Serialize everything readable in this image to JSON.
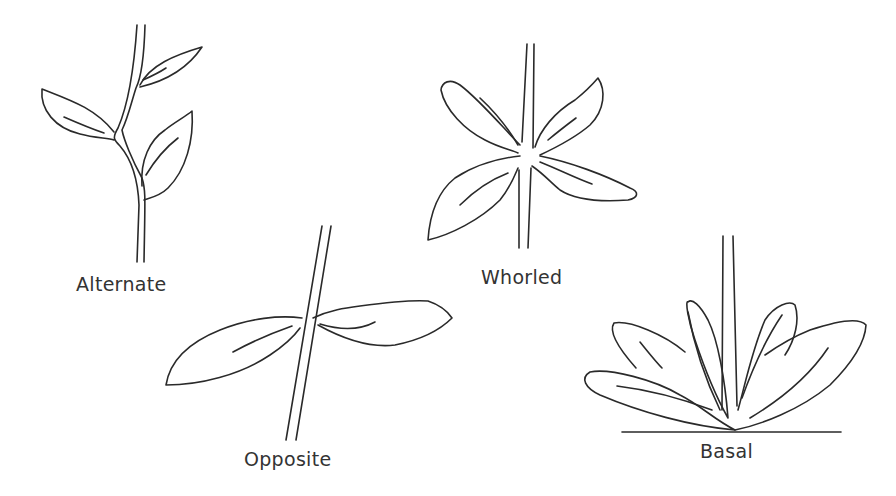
{
  "diagram": {
    "stroke_color": "#2a2a2a",
    "background": "#ffffff",
    "panels": [
      {
        "id": "alternate",
        "label": "Alternate",
        "leaves": 3
      },
      {
        "id": "opposite",
        "label": "Opposite",
        "leaves": 2
      },
      {
        "id": "whorled",
        "label": "Whorled",
        "leaves": 4
      },
      {
        "id": "basal",
        "label": "Basal",
        "leaves": 6
      }
    ]
  }
}
